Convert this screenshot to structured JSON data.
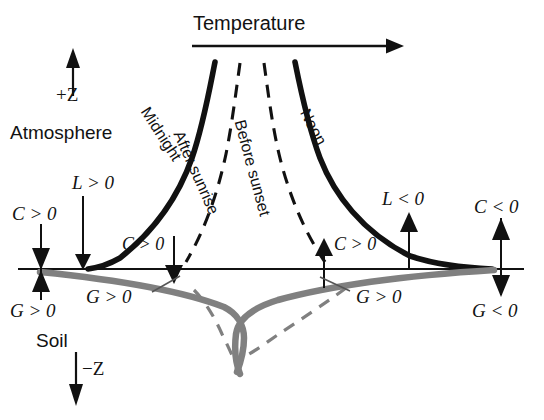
{
  "figure": {
    "title_axis_x": "Temperature",
    "axis_up_label": "+Z",
    "axis_down_label": "−Z",
    "region_top": "Atmosphere",
    "region_bottom": "Soil"
  },
  "curves": [
    {
      "id": "midnight",
      "label": "Midnight",
      "style": "solid",
      "side": "left",
      "medium": "atmosphere",
      "color": "#111111"
    },
    {
      "id": "after-sunrise",
      "label": "After sunrise",
      "style": "dashed",
      "side": "left",
      "medium": "atmosphere",
      "color": "#111111"
    },
    {
      "id": "before-sunset",
      "label": "Before sunset",
      "style": "dashed",
      "side": "right",
      "medium": "atmosphere",
      "color": "#111111"
    },
    {
      "id": "noon",
      "label": "Noon",
      "style": "solid",
      "side": "right",
      "medium": "atmosphere",
      "color": "#111111"
    }
  ],
  "flux_labels": [
    {
      "id": "l-positive",
      "text": "L > 0",
      "arrow": "down",
      "x": 72,
      "y": 178
    },
    {
      "id": "c-positive-left",
      "text": "C > 0",
      "arrow": "down",
      "x": 14,
      "y": 205
    },
    {
      "id": "c-positive-mid",
      "text": "C > 0",
      "arrow": "down",
      "x": 122,
      "y": 225
    },
    {
      "id": "c-positive-right",
      "text": "C > 0",
      "arrow": "up",
      "x": 329,
      "y": 225
    },
    {
      "id": "l-negative",
      "text": "L < 0",
      "arrow": "up",
      "x": 383,
      "y": 192
    },
    {
      "id": "c-negative",
      "text": "C < 0",
      "arrow": "up",
      "x": 474,
      "y": 197
    },
    {
      "id": "g-positive-left",
      "text": "G > 0",
      "arrow": "up",
      "x": 12,
      "y": 300
    },
    {
      "id": "g-positive-mid",
      "text": "G > 0",
      "arrow": "none",
      "x": 92,
      "y": 292
    },
    {
      "id": "g-positive-right",
      "text": "G > 0",
      "arrow": "none",
      "x": 352,
      "y": 292
    },
    {
      "id": "g-negative",
      "text": "G < 0",
      "arrow": "down",
      "x": 474,
      "y": 300
    }
  ],
  "colors": {
    "curve_atmosphere": "#111111",
    "curve_soil": "#808080",
    "axis": "#111111",
    "background": "#ffffff"
  }
}
